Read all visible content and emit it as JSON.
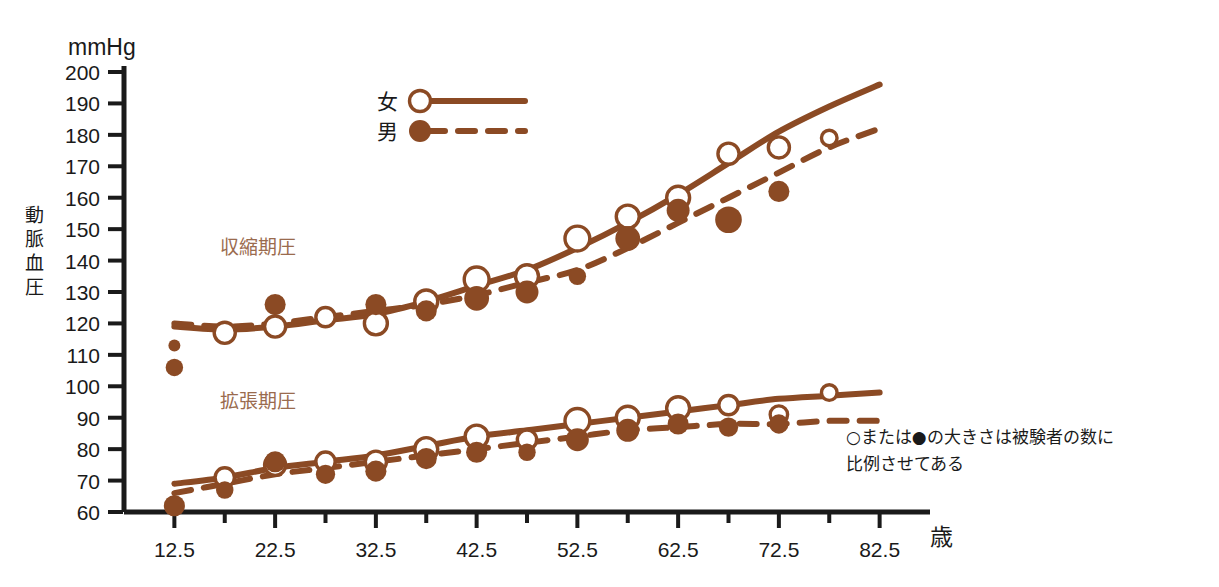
{
  "chart_data": {
    "type": "scatter",
    "title": "",
    "xlabel": "歳",
    "ylabel": "動脈血圧",
    "yunit": "mmHg",
    "xlim": [
      7.5,
      87.5
    ],
    "ylim": [
      60,
      200
    ],
    "grid": false,
    "legend_position": "top-center",
    "x_ticks_major": [
      12.5,
      22.5,
      32.5,
      42.5,
      52.5,
      62.5,
      72.5,
      82.5
    ],
    "x_ticks_minor": [
      17.5,
      27.5,
      37.5,
      47.5,
      57.5,
      67.5,
      77.5
    ],
    "y_ticks": [
      60,
      70,
      80,
      90,
      100,
      110,
      120,
      130,
      140,
      150,
      160,
      170,
      180,
      190,
      200
    ],
    "annotations": [
      {
        "name": "systolic-label",
        "text": "収縮期圧",
        "x": 17.0,
        "y": 142
      },
      {
        "name": "diastolic-label",
        "text": "拡張期圧",
        "x": 17.0,
        "y": 93
      }
    ],
    "note": "○または●の大きさは被験者の数に比例させてある",
    "note_line1": "○または●の大きさは被験者の数に",
    "note_line2": "比例させてある",
    "legend": [
      {
        "label": "女",
        "marker": "open-circle",
        "line": "solid"
      },
      {
        "label": "男",
        "marker": "filled-circle",
        "line": "dashed"
      }
    ],
    "series": [
      {
        "name": "女 収縮期圧",
        "sex": "female",
        "measure": "systolic",
        "marker": "open-circle",
        "line": "solid",
        "points": [
          {
            "x": 17.5,
            "y": 117,
            "n": 8
          },
          {
            "x": 22.5,
            "y": 119,
            "n": 8
          },
          {
            "x": 27.5,
            "y": 122,
            "n": 7
          },
          {
            "x": 32.5,
            "y": 120,
            "n": 9
          },
          {
            "x": 37.5,
            "y": 127,
            "n": 9
          },
          {
            "x": 42.5,
            "y": 134,
            "n": 10
          },
          {
            "x": 47.5,
            "y": 135,
            "n": 9
          },
          {
            "x": 52.5,
            "y": 147,
            "n": 10
          },
          {
            "x": 57.5,
            "y": 154,
            "n": 9
          },
          {
            "x": 62.5,
            "y": 160,
            "n": 9
          },
          {
            "x": 67.5,
            "y": 174,
            "n": 8
          },
          {
            "x": 72.5,
            "y": 176,
            "n": 8
          },
          {
            "x": 77.5,
            "y": 179,
            "n": 5
          }
        ],
        "curve": [
          {
            "x": 12.5,
            "y": 119
          },
          {
            "x": 17.5,
            "y": 118
          },
          {
            "x": 22.5,
            "y": 119
          },
          {
            "x": 27.5,
            "y": 121
          },
          {
            "x": 32.5,
            "y": 123
          },
          {
            "x": 37.5,
            "y": 127
          },
          {
            "x": 42.5,
            "y": 132
          },
          {
            "x": 47.5,
            "y": 137
          },
          {
            "x": 52.5,
            "y": 144
          },
          {
            "x": 57.5,
            "y": 152
          },
          {
            "x": 62.5,
            "y": 161
          },
          {
            "x": 67.5,
            "y": 171
          },
          {
            "x": 72.5,
            "y": 181
          },
          {
            "x": 77.5,
            "y": 189
          },
          {
            "x": 82.5,
            "y": 196
          }
        ]
      },
      {
        "name": "男 収縮期圧",
        "sex": "male",
        "measure": "systolic",
        "marker": "filled-circle",
        "line": "dashed",
        "points": [
          {
            "x": 12.5,
            "y": 113,
            "n": 3
          },
          {
            "x": 12.5,
            "y": 106,
            "n": 6
          },
          {
            "x": 22.5,
            "y": 126,
            "n": 8
          },
          {
            "x": 32.5,
            "y": 126,
            "n": 8
          },
          {
            "x": 37.5,
            "y": 124,
            "n": 8
          },
          {
            "x": 42.5,
            "y": 128,
            "n": 10
          },
          {
            "x": 47.5,
            "y": 130,
            "n": 9
          },
          {
            "x": 52.5,
            "y": 135,
            "n": 6
          },
          {
            "x": 57.5,
            "y": 147,
            "n": 10
          },
          {
            "x": 62.5,
            "y": 156,
            "n": 9
          },
          {
            "x": 67.5,
            "y": 153,
            "n": 11
          },
          {
            "x": 72.5,
            "y": 162,
            "n": 8
          }
        ],
        "curve": [
          {
            "x": 12.5,
            "y": 120
          },
          {
            "x": 17.5,
            "y": 119
          },
          {
            "x": 22.5,
            "y": 120
          },
          {
            "x": 27.5,
            "y": 122
          },
          {
            "x": 32.5,
            "y": 124
          },
          {
            "x": 37.5,
            "y": 126
          },
          {
            "x": 42.5,
            "y": 129
          },
          {
            "x": 47.5,
            "y": 133
          },
          {
            "x": 52.5,
            "y": 137
          },
          {
            "x": 57.5,
            "y": 144
          },
          {
            "x": 62.5,
            "y": 152
          },
          {
            "x": 67.5,
            "y": 160
          },
          {
            "x": 72.5,
            "y": 168
          },
          {
            "x": 77.5,
            "y": 176
          },
          {
            "x": 82.5,
            "y": 182
          }
        ]
      },
      {
        "name": "女 拡張期圧",
        "sex": "female",
        "measure": "diastolic",
        "marker": "open-circle",
        "line": "solid",
        "points": [
          {
            "x": 17.5,
            "y": 71,
            "n": 7
          },
          {
            "x": 22.5,
            "y": 75,
            "n": 8
          },
          {
            "x": 27.5,
            "y": 76,
            "n": 7
          },
          {
            "x": 32.5,
            "y": 76,
            "n": 8
          },
          {
            "x": 37.5,
            "y": 80,
            "n": 9
          },
          {
            "x": 42.5,
            "y": 84,
            "n": 9
          },
          {
            "x": 47.5,
            "y": 83,
            "n": 7
          },
          {
            "x": 52.5,
            "y": 89,
            "n": 10
          },
          {
            "x": 57.5,
            "y": 90,
            "n": 9
          },
          {
            "x": 62.5,
            "y": 93,
            "n": 9
          },
          {
            "x": 67.5,
            "y": 94,
            "n": 7
          },
          {
            "x": 72.5,
            "y": 91,
            "n": 6
          },
          {
            "x": 77.5,
            "y": 98,
            "n": 5
          }
        ],
        "curve": [
          {
            "x": 12.5,
            "y": 69
          },
          {
            "x": 17.5,
            "y": 71
          },
          {
            "x": 22.5,
            "y": 74
          },
          {
            "x": 27.5,
            "y": 76
          },
          {
            "x": 32.5,
            "y": 78
          },
          {
            "x": 37.5,
            "y": 81
          },
          {
            "x": 42.5,
            "y": 84
          },
          {
            "x": 47.5,
            "y": 86
          },
          {
            "x": 52.5,
            "y": 88
          },
          {
            "x": 57.5,
            "y": 90
          },
          {
            "x": 62.5,
            "y": 92
          },
          {
            "x": 67.5,
            "y": 94
          },
          {
            "x": 72.5,
            "y": 96
          },
          {
            "x": 77.5,
            "y": 97
          },
          {
            "x": 82.5,
            "y": 98
          }
        ]
      },
      {
        "name": "男 拡張期圧",
        "sex": "male",
        "measure": "diastolic",
        "marker": "filled-circle",
        "line": "dashed",
        "points": [
          {
            "x": 12.5,
            "y": 62,
            "n": 8
          },
          {
            "x": 17.5,
            "y": 67,
            "n": 6
          },
          {
            "x": 22.5,
            "y": 76,
            "n": 8
          },
          {
            "x": 27.5,
            "y": 72,
            "n": 7
          },
          {
            "x": 32.5,
            "y": 73,
            "n": 8
          },
          {
            "x": 37.5,
            "y": 77,
            "n": 8
          },
          {
            "x": 42.5,
            "y": 79,
            "n": 8
          },
          {
            "x": 47.5,
            "y": 79,
            "n": 6
          },
          {
            "x": 52.5,
            "y": 83,
            "n": 9
          },
          {
            "x": 57.5,
            "y": 86,
            "n": 9
          },
          {
            "x": 62.5,
            "y": 88,
            "n": 8
          },
          {
            "x": 67.5,
            "y": 87,
            "n": 7
          },
          {
            "x": 72.5,
            "y": 88,
            "n": 7
          }
        ],
        "curve": [
          {
            "x": 12.5,
            "y": 66
          },
          {
            "x": 17.5,
            "y": 69
          },
          {
            "x": 22.5,
            "y": 72
          },
          {
            "x": 27.5,
            "y": 74
          },
          {
            "x": 32.5,
            "y": 76
          },
          {
            "x": 37.5,
            "y": 78
          },
          {
            "x": 42.5,
            "y": 80
          },
          {
            "x": 47.5,
            "y": 82
          },
          {
            "x": 52.5,
            "y": 84
          },
          {
            "x": 57.5,
            "y": 86
          },
          {
            "x": 62.5,
            "y": 87
          },
          {
            "x": 67.5,
            "y": 88
          },
          {
            "x": 72.5,
            "y": 88
          },
          {
            "x": 77.5,
            "y": 89
          },
          {
            "x": 82.5,
            "y": 89
          }
        ]
      }
    ],
    "colors": {
      "series_brown": "#8B4A24",
      "label_brown": "#9A6B4E",
      "axis_black": "#1a1a1a",
      "background": "#ffffff"
    }
  }
}
